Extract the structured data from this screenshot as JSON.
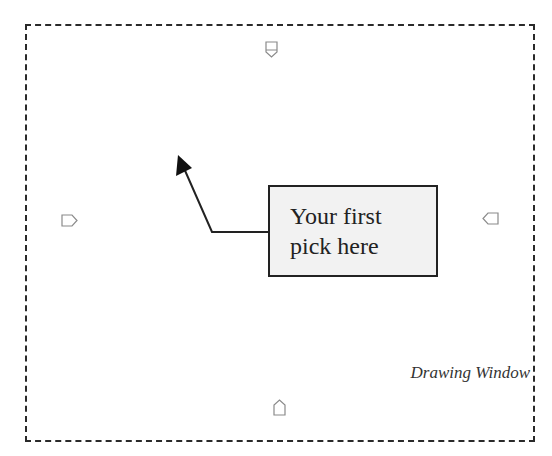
{
  "callout": {
    "line1": "Your first",
    "line2": "pick here"
  },
  "window_label": "Drawing Window",
  "markers": [
    {
      "name": "top-pick-marker",
      "direction": "down"
    },
    {
      "name": "left-pick-marker",
      "direction": "right"
    },
    {
      "name": "right-pick-marker",
      "direction": "left"
    },
    {
      "name": "bottom-pick-marker",
      "direction": "up"
    }
  ],
  "colors": {
    "border": "#2a2a2a",
    "callout_fill": "#f2f2f2",
    "marker": "#8a8a8a"
  }
}
